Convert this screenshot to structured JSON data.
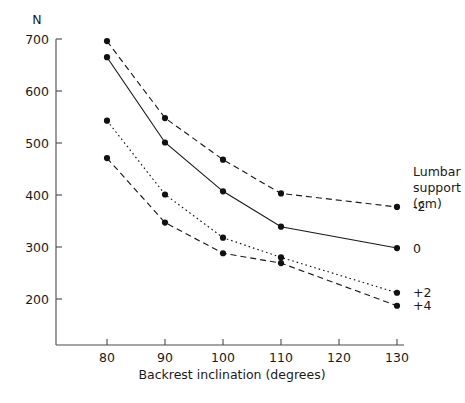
{
  "chart_data": {
    "type": "line",
    "title": "",
    "xlabel": "Backrest inclination (degrees)",
    "ylabel": "N",
    "ylabel_note": "N (newtons), placed above the y axis",
    "x": [
      80,
      90,
      100,
      110,
      130
    ],
    "xlim": [
      75,
      130
    ],
    "ylim": [
      150,
      720
    ],
    "xticks": [
      80,
      90,
      100,
      110,
      120,
      130
    ],
    "yticks": [
      200,
      300,
      400,
      500,
      600,
      700
    ],
    "grid": false,
    "legend_title_lines": [
      "Lumbar",
      "support",
      "(cm)"
    ],
    "legend_position": "right",
    "series": [
      {
        "name": "-2",
        "label": "-2",
        "style": "dashed",
        "values": [
          696,
          548,
          468,
          403,
          377
        ]
      },
      {
        "name": "0",
        "label": "0",
        "style": "solid",
        "values": [
          665,
          501,
          407,
          339,
          298
        ]
      },
      {
        "name": "+2",
        "label": "+2",
        "style": "dotted",
        "values": [
          543,
          401,
          318,
          280,
          212
        ]
      },
      {
        "name": "+4",
        "label": "+4",
        "style": "dashed",
        "values": [
          471,
          347,
          288,
          269,
          187
        ]
      }
    ]
  },
  "axes": {
    "y_unit": "N",
    "x_title": "Backrest inclination (degrees)",
    "y_tick_labels": [
      "700",
      "600",
      "500",
      "400",
      "300",
      "200"
    ],
    "x_tick_labels": [
      "80",
      "90",
      "100",
      "110",
      "120",
      "130"
    ]
  },
  "legend": {
    "title_line_1": "Lumbar",
    "title_line_2": "support",
    "title_line_3": "(cm)",
    "entries": [
      {
        "label": "-2"
      },
      {
        "label": "0"
      },
      {
        "label": "+2"
      },
      {
        "label": "+4"
      }
    ]
  },
  "colors": {
    "axis": "#4a4a4a",
    "line": "#1a1a1a",
    "marker": "#111111",
    "text": "#1a1a1a",
    "background": "#ffffff"
  }
}
